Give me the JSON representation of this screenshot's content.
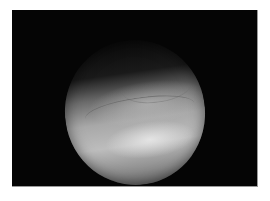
{
  "image": {
    "description": "Grayscale endoscopic view: circular field of view with bright tissue surface on black background",
    "colors": {
      "page_background": "#ffffff",
      "frame_background": "#050505",
      "highlight": "#ebebeb",
      "midtone": "#a8a8a8",
      "shadow": "#1a1a1a"
    }
  }
}
